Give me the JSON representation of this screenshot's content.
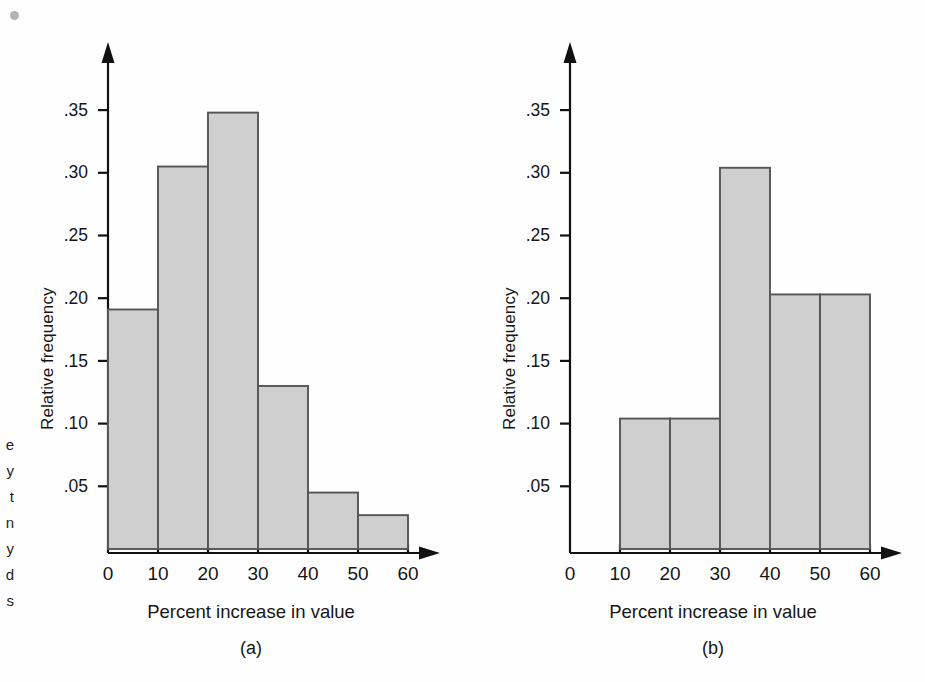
{
  "page": {
    "background_color": "#fefefe",
    "ink_color": "#161616",
    "bar_fill_color": "#cfcfcf",
    "bar_stroke_color": "#555555",
    "speck_color": "#9b9b9b"
  },
  "margin_caption_fragments": [
    "e",
    "y",
    "t",
    "n",
    "y",
    "d",
    "s"
  ],
  "panels": [
    {
      "id": "a",
      "caption": "(a)",
      "xlabel": "Percent increase in value",
      "ylabel": "Relative frequency"
    },
    {
      "id": "b",
      "caption": "(b)",
      "xlabel": "Percent increase in value",
      "ylabel": "Relative frequency"
    }
  ],
  "chart_data": [
    {
      "type": "bar",
      "id": "a",
      "title": "(a)",
      "xlabel": "Percent increase in value",
      "ylabel": "Relative frequency",
      "categories": [
        "0-10",
        "10-20",
        "20-30",
        "30-40",
        "40-50",
        "50-60"
      ],
      "bin_edges": [
        0,
        10,
        20,
        30,
        40,
        50,
        60
      ],
      "values": [
        0.191,
        0.305,
        0.348,
        0.13,
        0.045,
        0.027
      ],
      "xlim": [
        0,
        60
      ],
      "ylim": [
        0,
        0.38
      ],
      "xticks": [
        0,
        10,
        20,
        30,
        40,
        50,
        60
      ],
      "xtick_labels": [
        "0",
        "10",
        "20",
        "30",
        "40",
        "50",
        "60"
      ],
      "yticks": [
        0.05,
        0.1,
        0.15,
        0.2,
        0.25,
        0.3,
        0.35
      ],
      "ytick_labels": [
        ".05",
        ".10",
        ".15",
        ".20",
        ".25",
        ".30",
        ".35"
      ],
      "grid": false,
      "legend": false
    },
    {
      "type": "bar",
      "id": "b",
      "title": "(b)",
      "xlabel": "Percent increase in value",
      "ylabel": "Relative frequency",
      "categories": [
        "10-20",
        "20-30",
        "30-40",
        "40-50",
        "50-60"
      ],
      "bin_edges": [
        10,
        20,
        30,
        40,
        50,
        60
      ],
      "values": [
        0.104,
        0.104,
        0.304,
        0.203,
        0.203
      ],
      "xlim": [
        0,
        60
      ],
      "ylim": [
        0,
        0.38
      ],
      "xticks": [
        0,
        10,
        20,
        30,
        40,
        50,
        60
      ],
      "xtick_labels": [
        "0",
        "10",
        "20",
        "30",
        "40",
        "50",
        "60"
      ],
      "yticks": [
        0.05,
        0.1,
        0.15,
        0.2,
        0.25,
        0.3,
        0.35
      ],
      "ytick_labels": [
        ".05",
        ".10",
        ".15",
        ".20",
        ".25",
        ".30",
        ".35"
      ],
      "grid": false,
      "legend": false
    }
  ]
}
